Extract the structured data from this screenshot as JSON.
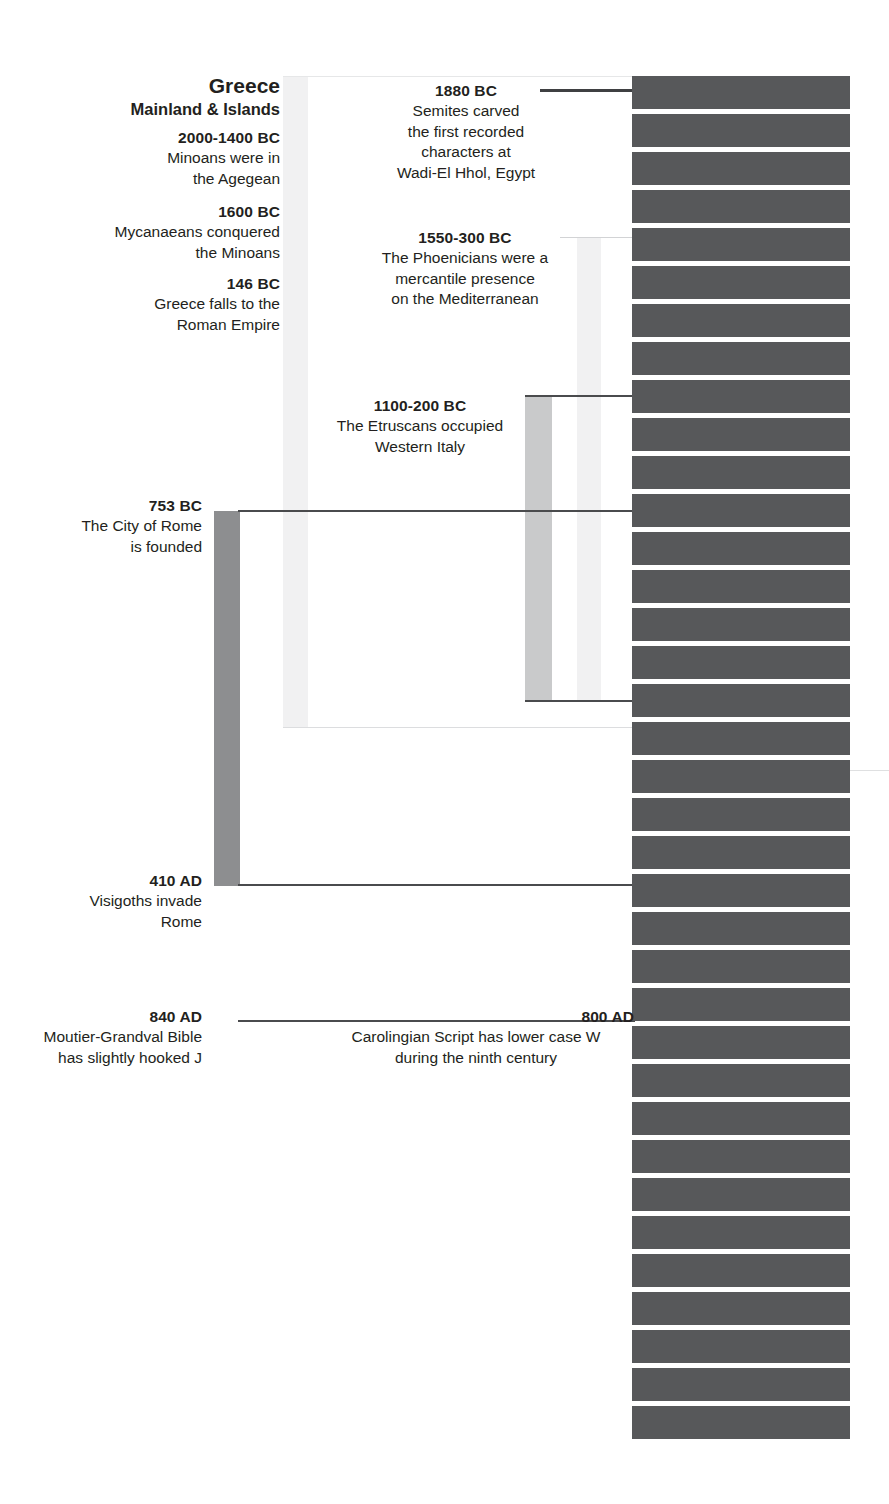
{
  "diagram": {
    "kind": "historical-timeline",
    "heading": {
      "region": "Greece",
      "region_sub": "Mainland & Islands"
    },
    "colors": {
      "text": "#231f20",
      "stripe": "#57585a",
      "bar_dark": "#8d8e90",
      "bar_mid": "#c9cacb",
      "bar_light": "#e8e9ea",
      "bar_lightest": "#f1f1f2",
      "rule_dark": "#4a4b4d",
      "rule_light": "#d7d8da"
    },
    "events": [
      {
        "id": "greece-minoans",
        "date": "2000-1400 BC",
        "text_lines": [
          "Minoans were in",
          "the Agegean"
        ]
      },
      {
        "id": "greece-mycenaeans",
        "date": "1600 BC",
        "text_lines": [
          "Mycanaeans conquered",
          "the Minoans"
        ]
      },
      {
        "id": "greece-roman",
        "date": "146 BC",
        "text_lines": [
          "Greece falls to the",
          "Roman Empire"
        ]
      },
      {
        "id": "semites-wadi-el-hhol",
        "date": "1880 BC",
        "text_lines": [
          "Semites carved",
          "the  first recorded",
          "characters at",
          "Wadi-El Hhol, Egypt"
        ]
      },
      {
        "id": "phoenicians",
        "date": "1550-300 BC",
        "text_lines": [
          "The Phoenicians were a",
          "mercantile presence",
          "on the Mediterranean"
        ]
      },
      {
        "id": "etruscans",
        "date": "1100-200 BC",
        "text_lines": [
          "The Etruscans occupied",
          "Western Italy"
        ]
      },
      {
        "id": "rome-founded",
        "date": "753 BC",
        "text_lines": [
          "The City of Rome",
          "is founded"
        ]
      },
      {
        "id": "visigoths",
        "date": "410 AD",
        "text_lines": [
          "Visigoths invade",
          "Rome"
        ]
      },
      {
        "id": "carolingian",
        "date": "800 AD",
        "text_lines": [
          "Carolingian Script has lower case W",
          "during the ninth century"
        ]
      },
      {
        "id": "moutier-grandval",
        "date": "840 AD",
        "text_lines": [
          "Moutier-Grandval Bible",
          "has slightly hooked J"
        ]
      }
    ]
  }
}
